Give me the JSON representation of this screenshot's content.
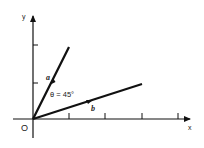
{
  "diagram": {
    "title": "",
    "axes": {
      "x_label": "x",
      "y_label": "y",
      "origin_label": "O"
    },
    "vectors": [
      {
        "name": "a",
        "label": "a"
      },
      {
        "name": "b",
        "label": "b"
      }
    ],
    "angle_label": "θ = 45°",
    "colors": {
      "ink": "#111111",
      "background": "#ffffff"
    }
  }
}
